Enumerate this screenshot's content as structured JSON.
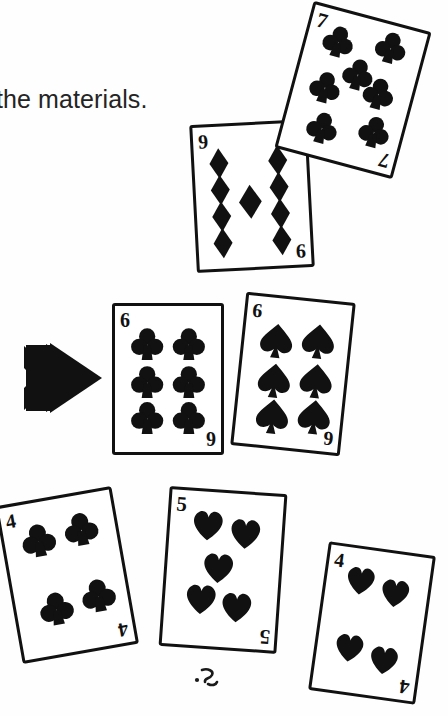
{
  "figure": {
    "background_color": "#ffffff",
    "ink_color": "#111111",
    "caption_text": "the materials.",
    "caption_color": "#242424"
  },
  "arrow": {
    "name": "double-chevron-arrow",
    "direction": "right",
    "color": "#111111"
  },
  "scribble": {
    "name": "stray-pencil-mark",
    "description": "small handwritten smudge below the five of hearts"
  },
  "cards": [
    {
      "id": "card-7-clubs",
      "rank": "7",
      "suit": "clubs",
      "suit_glyph": "♣",
      "pip_count": 7,
      "index_top_left": "7",
      "index_bottom_right": "7",
      "group": "top",
      "rotation_deg": 15
    },
    {
      "id": "card-9-diamonds",
      "rank": "9",
      "suit": "diamonds",
      "suit_glyph": "♦",
      "pip_count": 9,
      "index_top_left": "9",
      "index_bottom_right": "9",
      "group": "top",
      "rotation_deg": -3
    },
    {
      "id": "card-6-clubs",
      "rank": "6",
      "suit": "clubs",
      "suit_glyph": "♣",
      "pip_count": 6,
      "index_top_left": "6",
      "index_bottom_right": "6",
      "group": "middle",
      "rotation_deg": 0
    },
    {
      "id": "card-6-spades",
      "rank": "6",
      "suit": "spades",
      "suit_glyph": "♠",
      "pip_count": 6,
      "index_top_left": "6",
      "index_bottom_right": "6",
      "group": "middle",
      "rotation_deg": 6
    },
    {
      "id": "card-4-clubs",
      "rank": "4",
      "suit": "clubs",
      "suit_glyph": "♣",
      "pip_count": 4,
      "index_top_left": "4",
      "index_bottom_right": "4",
      "group": "bottom",
      "rotation_deg": -10
    },
    {
      "id": "card-5-hearts",
      "rank": "5",
      "suit": "hearts",
      "suit_glyph": "♥",
      "pip_count": 5,
      "index_top_left": "5",
      "index_bottom_right": "5",
      "group": "bottom",
      "rotation_deg": 4
    },
    {
      "id": "card-4-hearts",
      "rank": "4",
      "suit": "hearts",
      "suit_glyph": "♥",
      "pip_count": 4,
      "index_top_left": "4",
      "index_bottom_right": "4",
      "group": "bottom",
      "rotation_deg": 8
    }
  ]
}
